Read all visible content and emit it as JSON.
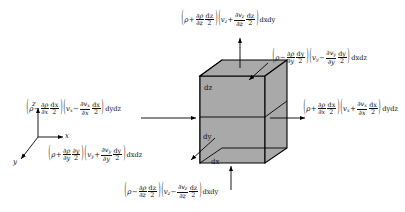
{
  "figure": {
    "type": "fluid-element-mass-flux-diagram",
    "cube": {
      "fill_color": "#a9a9a9",
      "edge_color": "#000000",
      "dimension_labels": {
        "dx": "dx",
        "dy": "dy",
        "dz": "dz"
      }
    },
    "axes": {
      "x_label": "x",
      "y_label": "y",
      "z_label": "z"
    },
    "fluxes": {
      "top_positive_z": {
        "face": "+z",
        "rho_sign": "+",
        "rho_symbol": "ρ",
        "rho_partial_num": "∂ρ",
        "rho_partial_den": "∂z",
        "rho_step_num": "dz",
        "rho_step_den": "2",
        "v_symbol": "v",
        "v_sub": "z",
        "v_sign": "+",
        "v_partial_num": "∂v",
        "v_partial_sub": "z",
        "v_partial_den": "∂z",
        "v_step_num": "dz",
        "v_step_den": "2",
        "area": "dxdy"
      },
      "bottom_negative_z": {
        "face": "-z",
        "rho_sign": "−",
        "rho_symbol": "ρ",
        "rho_partial_num": "∂ρ",
        "rho_partial_den": "∂z",
        "rho_step_num": "dz",
        "rho_step_den": "2",
        "v_symbol": "v",
        "v_sub": "z",
        "v_sign": "−",
        "v_partial_num": "∂v",
        "v_partial_sub": "z",
        "v_partial_den": "∂z",
        "v_step_num": "dz",
        "v_step_den": "2",
        "area": "dxdy"
      },
      "right_positive_x": {
        "face": "+x",
        "rho_sign": "+",
        "rho_symbol": "ρ",
        "rho_partial_num": "∂ρ",
        "rho_partial_den": "∂x",
        "rho_step_num": "dx",
        "rho_step_den": "2",
        "v_symbol": "v",
        "v_sub": "x",
        "v_sign": "+",
        "v_partial_num": "∂v",
        "v_partial_sub": "x",
        "v_partial_den": "∂x",
        "v_step_num": "dx",
        "v_step_den": "2",
        "area": "dydz"
      },
      "left_negative_x": {
        "face": "-x",
        "rho_sign": "−",
        "rho_symbol": "ρ",
        "rho_partial_num": "∂ρ",
        "rho_partial_den": "∂x",
        "rho_step_num": "dx",
        "rho_step_den": "2",
        "v_symbol": "v",
        "v_sub": "x",
        "v_sign": "−",
        "v_partial_num": "∂v",
        "v_partial_sub": "x",
        "v_partial_den": "∂x",
        "v_step_num": "dx",
        "v_step_den": "2",
        "area": "dydz"
      },
      "top_right_negative_y": {
        "face": "-y",
        "rho_sign": "−",
        "rho_symbol": "ρ",
        "rho_partial_num": "∂ρ",
        "rho_partial_den": "∂y",
        "rho_step_num": "dy",
        "rho_step_den": "2",
        "v_symbol": "v",
        "v_sub": "y",
        "v_sign": "−",
        "v_partial_num": "∂v",
        "v_partial_sub": "y",
        "v_partial_den": "∂y",
        "v_step_num": "dy",
        "v_step_den": "2",
        "area": "dxdz"
      },
      "bottom_left_positive_y": {
        "face": "+y",
        "rho_sign": "+",
        "rho_symbol": "ρ",
        "rho_partial_num": "∂ρ",
        "rho_partial_den": "∂y",
        "rho_step_num": "∂y",
        "rho_step_den": "2",
        "v_symbol": "v",
        "v_sub": "y",
        "v_sign": "+",
        "v_partial_num": "∂v",
        "v_partial_sub": "y",
        "v_partial_den": "∂y",
        "v_step_num": "dy",
        "v_step_den": "2",
        "area": "dxdz"
      }
    }
  }
}
